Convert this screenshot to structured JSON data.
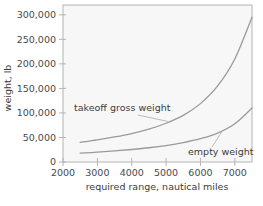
{
  "chart_data": {
    "type": "line",
    "title": "",
    "xlabel": "required range, nautical miles",
    "ylabel": "weight, lb",
    "xlim": [
      2000,
      7500
    ],
    "ylim": [
      0,
      320000
    ],
    "xticks": [
      2000,
      3000,
      4000,
      5000,
      6000,
      7000
    ],
    "xtick_labels": [
      "2000",
      "3000",
      "4000",
      "5000",
      "6000",
      "7000"
    ],
    "yticks": [
      0,
      50000,
      100000,
      150000,
      200000,
      250000,
      300000
    ],
    "ytick_labels": [
      "0",
      "50,000",
      "100,000",
      "150,000",
      "200,000",
      "250,000",
      "300,000"
    ],
    "grid": false,
    "legend_position": "inline-annotations",
    "line_color": "#9a9a9a",
    "axis_color": "#b4b4b4",
    "plot_background": "#f7f7f7",
    "x": [
      2500,
      3000,
      3500,
      4000,
      4500,
      5000,
      5500,
      6000,
      6500,
      7000,
      7500
    ],
    "series": [
      {
        "name": "takeoff gross weight",
        "annotation": "takeoff gross weight",
        "values": [
          40000,
          45000,
          51000,
          58000,
          67000,
          79000,
          95000,
          119000,
          155000,
          210000,
          295000
        ]
      },
      {
        "name": "empty weight",
        "annotation": "empty weight",
        "values": [
          18000,
          20000,
          22500,
          25500,
          29000,
          33500,
          39500,
          47500,
          59000,
          78000,
          110000
        ]
      }
    ]
  },
  "annotations": {
    "takeoff_label": "takeoff gross weight",
    "empty_label": "empty weight"
  },
  "axes": {
    "x_title": "required range, nautical miles",
    "y_title": "weight, lb"
  }
}
